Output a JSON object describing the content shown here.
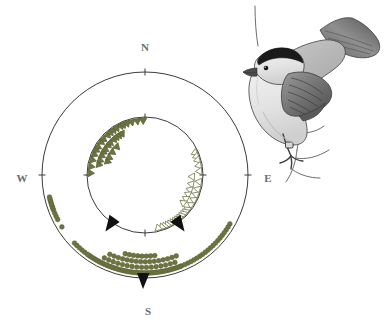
{
  "figure": {
    "type": "circular-orientation-plot",
    "title": "",
    "background_color": "#ffffff",
    "width": 390,
    "height": 323
  },
  "compass": {
    "center_x": 145,
    "center_y": 175,
    "outer_radius": 103,
    "inner_radius": 58,
    "ring_color": "#3a3a3a",
    "ring_width": 1,
    "labels": [
      {
        "key": "north",
        "text": "N",
        "angle_deg": 0,
        "x": 145,
        "y": 48
      },
      {
        "key": "east",
        "text": "E",
        "angle_deg": 90,
        "x": 268,
        "y": 179
      },
      {
        "key": "south",
        "text": "S",
        "angle_deg": 180,
        "x": 148,
        "y": 312
      },
      {
        "key": "west",
        "text": "W",
        "angle_deg": 270,
        "x": 22,
        "y": 179
      }
    ],
    "ticks": [
      0,
      90,
      180,
      270
    ]
  },
  "markers": {
    "filled_triangle": {
      "name": "filled-triangle-marker",
      "fill": "#6e7440",
      "stroke": "#5c6236",
      "size": 6
    },
    "open_triangle": {
      "name": "open-triangle-marker",
      "fill": "#ffffff",
      "stroke": "#6e7440",
      "size": 6
    },
    "dot": {
      "name": "dot-marker",
      "fill": "#6e7440",
      "stroke": "#5c6236",
      "radius": 2.4
    },
    "mean_vector_arrow": {
      "name": "mean-vector-arrowhead",
      "fill": "#111111"
    }
  },
  "chart_data": {
    "type": "scatter",
    "title": "",
    "xlabel": "",
    "ylabel": "",
    "coordinate_system": "polar-compass",
    "angle_convention": "degrees clockwise from North",
    "rings": [
      {
        "name": "inner-ring",
        "radius": 58,
        "description": "directional headings of individual birds, plotted as triangles on the inner circle"
      },
      {
        "name": "outer-ring",
        "radius": 103,
        "description": "directional headings plotted as dots stacked outward from the outer circle"
      }
    ],
    "series": [
      {
        "name": "Group A (filled triangles)",
        "marker": "filled-triangle",
        "ring": "inner-ring",
        "color": "#6e7440",
        "n": 33,
        "values_deg": [
          272,
          279,
          283,
          286,
          288,
          290,
          292,
          294,
          296,
          297,
          299,
          301,
          303,
          305,
          307,
          309,
          311,
          313,
          315,
          317,
          319,
          321,
          323,
          325,
          327,
          329,
          331,
          334,
          337,
          341,
          346,
          352,
          358
        ],
        "stack_levels": [
          0,
          0,
          1,
          0,
          1,
          2,
          0,
          1,
          2,
          0,
          1,
          0,
          1,
          2,
          0,
          1,
          0,
          1,
          2,
          0,
          1,
          0,
          1,
          0,
          1,
          0,
          1,
          0,
          0,
          0,
          0,
          0,
          0
        ],
        "mean_vector_deg": 215,
        "mean_vector_label": "SW"
      },
      {
        "name": "Group B (open triangles)",
        "marker": "open-triangle",
        "ring": "inner-ring",
        "color": "#6e7440",
        "n": 29,
        "values_deg": [
          66,
          70,
          74,
          80,
          86,
          92,
          97,
          101,
          105,
          108,
          111,
          114,
          117,
          120,
          123,
          126,
          129,
          132,
          135,
          138,
          141,
          144,
          147,
          150,
          153,
          156,
          159,
          162,
          166
        ],
        "stack_levels": [
          0,
          0,
          0,
          0,
          0,
          1,
          0,
          1,
          0,
          1,
          0,
          1,
          0,
          1,
          0,
          1,
          0,
          0,
          0,
          0,
          0,
          0,
          0,
          0,
          0,
          0,
          0,
          0,
          0
        ],
        "mean_vector_deg": 145,
        "mean_vector_label": "SE"
      },
      {
        "name": "Group C (dots, outer ring)",
        "marker": "dot",
        "ring": "outer-ring",
        "color": "#6e7440",
        "n": 96,
        "values_deg": [
          238,
          243,
          245,
          247,
          249,
          250,
          251,
          252,
          253,
          254,
          255,
          256,
          257,
          158,
          159,
          160,
          161,
          162,
          163,
          164,
          165,
          166,
          167,
          168,
          169,
          170,
          171,
          172,
          173,
          174,
          175,
          176,
          177,
          178,
          179,
          180,
          181,
          182,
          183,
          184,
          185,
          186,
          187,
          188,
          189,
          190,
          191,
          192,
          193,
          194,
          195,
          196,
          197,
          198,
          199,
          200,
          201,
          202,
          203,
          204,
          205,
          206,
          207,
          208,
          209,
          210,
          211,
          212,
          213,
          214,
          215,
          216,
          218,
          220,
          222,
          224,
          226,
          128,
          130,
          132,
          134,
          136,
          138,
          140,
          142,
          144,
          146,
          148,
          150,
          152,
          154,
          156,
          120,
          122,
          124,
          126
        ],
        "mean_vector_deg": 181,
        "mean_vector_label": "S"
      }
    ],
    "mean_vectors": [
      {
        "name": "mean-vector-sw",
        "angle_deg": 215,
        "ring": "inner-ring"
      },
      {
        "name": "mean-vector-se",
        "angle_deg": 145,
        "ring": "inner-ring"
      },
      {
        "name": "mean-vector-s",
        "angle_deg": 181,
        "ring": "outer-ring"
      }
    ]
  },
  "illustration": {
    "name": "blackcap-bird-illustration",
    "subject": "perched songbird with dark cap on a branch",
    "style": "grayscale pencil drawing",
    "position": {
      "x": 248,
      "y": 4,
      "width": 140,
      "height": 156
    },
    "colors": {
      "cap": "#1c1c1c",
      "body_light": "#e9e9e9",
      "wing_mid": "#8c8c8c",
      "wing_dark": "#4a4a4a",
      "outline": "#3d3d3d",
      "branch": "#5a5a5a"
    }
  }
}
